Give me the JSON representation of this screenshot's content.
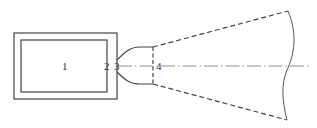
{
  "diagram": {
    "type": "schematic",
    "labels": [
      {
        "id": "1",
        "text": "1",
        "x": 62,
        "y": 70
      },
      {
        "id": "2",
        "text": "2",
        "x": 104,
        "y": 70
      },
      {
        "id": "3",
        "text": "3",
        "x": 114,
        "y": 70
      },
      {
        "id": "4",
        "text": "4",
        "x": 156,
        "y": 70
      }
    ],
    "colors": {
      "stroke": "#444444",
      "background": "#ffffff"
    }
  }
}
